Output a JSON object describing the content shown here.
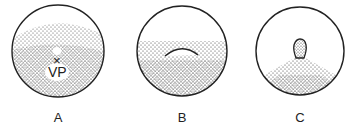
{
  "panels": [
    {
      "label": "A",
      "annotation_mark": "×",
      "annotation_text": "VP"
    },
    {
      "label": "B"
    },
    {
      "label": "C"
    }
  ],
  "colors": {
    "ink": "#222222",
    "background": "#ffffff"
  }
}
